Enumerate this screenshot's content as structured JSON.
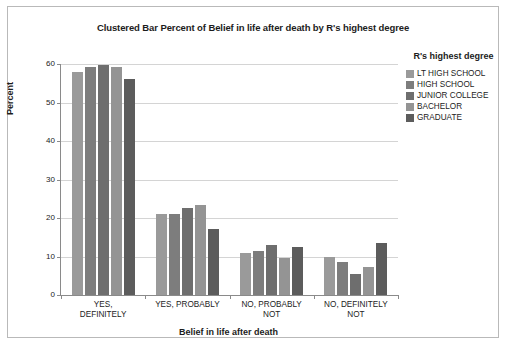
{
  "chart_data": {
    "type": "bar",
    "title": "Clustered Bar Percent of Belief in life after death by R's highest degree",
    "xlabel": "Belief in life after death",
    "ylabel": "Percent",
    "ylim": [
      0,
      60
    ],
    "yticks": [
      0,
      10,
      20,
      30,
      40,
      50,
      60
    ],
    "grid": true,
    "legend_position": "right",
    "legend_title": "R's highest degree",
    "categories": [
      "YES,\nDEFINITELY",
      "YES, PROBABLY",
      "NO, PROBABLY\nNOT",
      "NO, DEFINITELY\nNOT"
    ],
    "series": [
      {
        "name": "LT HIGH SCHOOL",
        "color": "#9a9a9a",
        "values": [
          58.0,
          21.0,
          11.0,
          10.0
        ]
      },
      {
        "name": "HIGH SCHOOL",
        "color": "#7d7d7d",
        "values": [
          59.3,
          21.0,
          11.5,
          8.6
        ]
      },
      {
        "name": "JUNIOR COLLEGE",
        "color": "#6e6e6e",
        "values": [
          59.7,
          22.5,
          13.0,
          5.5
        ]
      },
      {
        "name": "BACHELOR",
        "color": "#949494",
        "values": [
          59.3,
          23.5,
          9.6,
          7.2
        ]
      },
      {
        "name": "GRADUATE",
        "color": "#5c5c5c",
        "values": [
          56.0,
          17.2,
          12.6,
          13.5
        ]
      }
    ]
  }
}
